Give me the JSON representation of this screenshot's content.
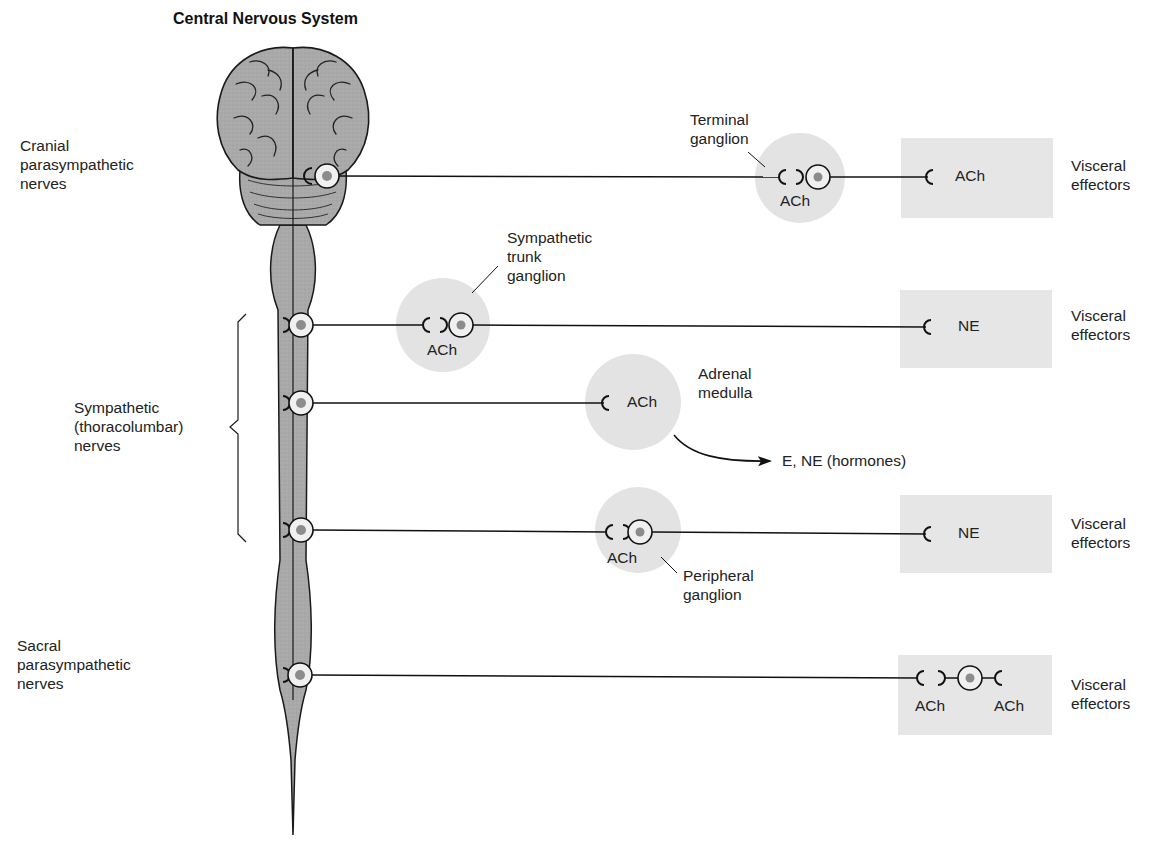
{
  "title": "Central Nervous System",
  "colors": {
    "cns_fill": "#a8a8a8",
    "ganglion_fill": "#e3e3e3",
    "effector_fill": "#e6e6e6",
    "neuron_body": "#f0f0f0",
    "nucleus": "#8c8c8c",
    "line": "#1a1a1a"
  },
  "left_labels": {
    "cranial": "Cranial\nparasympathetic\nnerves",
    "sympathetic": "Sympathetic\n(thoracolumbar)\nnerves",
    "sacral": "Sacral\nparasympathetic\nnerves"
  },
  "pathways": [
    {
      "name": "cranial-parasympathetic",
      "ganglion_label": "Terminal\nganglion",
      "ganglion_transmitter": "ACh",
      "effector_transmitter": "ACh",
      "effector_label": "Visceral\neffectors"
    },
    {
      "name": "sympathetic-trunk",
      "ganglion_label": "Sympathetic\ntrunk\nganglion",
      "ganglion_transmitter": "ACh",
      "effector_transmitter": "NE",
      "effector_label": "Visceral\neffectors"
    },
    {
      "name": "sympathetic-adrenal",
      "ganglion_label": "Adrenal\nmedulla",
      "ganglion_transmitter": "ACh",
      "output_label": "E, NE (hormones)"
    },
    {
      "name": "sympathetic-peripheral",
      "ganglion_label": "Peripheral\nganglion",
      "ganglion_transmitter": "ACh",
      "effector_transmitter": "NE",
      "effector_label": "Visceral\neffectors"
    },
    {
      "name": "sacral-parasympathetic",
      "ganglion_transmitter": "ACh",
      "effector_transmitter": "ACh",
      "effector_label": "Visceral\neffectors"
    }
  ]
}
